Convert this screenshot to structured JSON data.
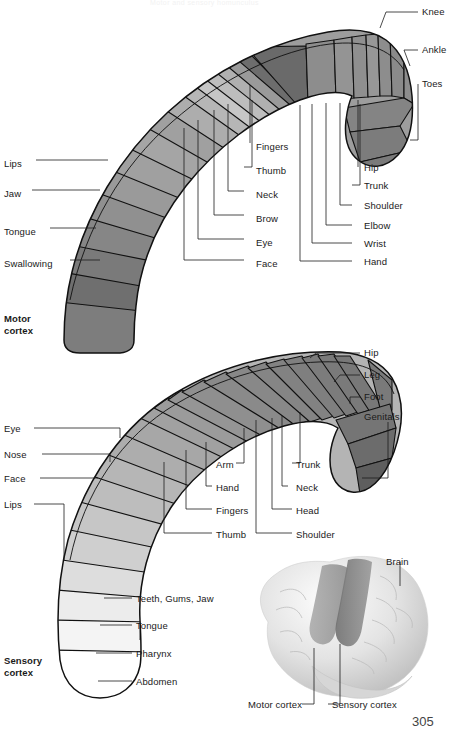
{
  "figure": {
    "top_title": "Motor and sensory homunculus",
    "page_number": "305"
  },
  "motor_cortex": {
    "caption": "Motor\ncortex",
    "left_labels": [
      {
        "text": "Lips",
        "x": 4,
        "y": 163
      },
      {
        "text": "Jaw",
        "x": 4,
        "y": 193
      },
      {
        "text": "Tongue",
        "x": 4,
        "y": 231
      },
      {
        "text": "Swallowing",
        "x": 4,
        "y": 263
      }
    ],
    "center_labels": [
      {
        "text": "Fingers",
        "x": 256,
        "y": 146
      },
      {
        "text": "Thumb",
        "x": 262,
        "y": 170
      },
      {
        "text": "Neck",
        "x": 256,
        "y": 194
      },
      {
        "text": "Brow",
        "x": 256,
        "y": 218
      },
      {
        "text": "Eye",
        "x": 256,
        "y": 242
      },
      {
        "text": "Face",
        "x": 256,
        "y": 263
      }
    ],
    "right_labels": [
      {
        "text": "Hip",
        "x": 364,
        "y": 170
      },
      {
        "text": "Trunk",
        "x": 364,
        "y": 188
      },
      {
        "text": "Shoulder",
        "x": 364,
        "y": 208
      },
      {
        "text": "Elbow",
        "x": 364,
        "y": 228
      },
      {
        "text": "Wrist",
        "x": 364,
        "y": 246
      },
      {
        "text": "Hand",
        "x": 364,
        "y": 264
      }
    ],
    "far_right_labels": [
      {
        "text": "Knee",
        "x": 422,
        "y": 10
      },
      {
        "text": "Ankle",
        "x": 422,
        "y": 48
      },
      {
        "text": "Toes",
        "x": 422,
        "y": 80
      }
    ]
  },
  "sensory_cortex": {
    "caption": "Sensory\ncortex",
    "left_labels": [
      {
        "text": "Eye",
        "x": 4,
        "y": 424
      },
      {
        "text": "Nose",
        "x": 4,
        "y": 450
      },
      {
        "text": "Face",
        "x": 4,
        "y": 474
      },
      {
        "text": "Lips",
        "x": 4,
        "y": 500
      }
    ],
    "lower_left_labels": [
      {
        "text": "Teeth, Gums, Jaw",
        "x": 136,
        "y": 595
      },
      {
        "text": "Tongue",
        "x": 136,
        "y": 622
      },
      {
        "text": "Pharynx",
        "x": 136,
        "y": 650
      },
      {
        "text": "Abdomen",
        "x": 136,
        "y": 678
      }
    ],
    "center_labels": [
      {
        "text": "Arm",
        "x": 216,
        "y": 466
      },
      {
        "text": "Hand",
        "x": 216,
        "y": 489
      },
      {
        "text": "Fingers",
        "x": 216,
        "y": 512
      },
      {
        "text": "Thumb",
        "x": 216,
        "y": 536
      }
    ],
    "right_labels": [
      {
        "text": "Trunk",
        "x": 296,
        "y": 466
      },
      {
        "text": "Neck",
        "x": 296,
        "y": 489
      },
      {
        "text": "Head",
        "x": 296,
        "y": 512
      },
      {
        "text": "Shoulder",
        "x": 296,
        "y": 536
      }
    ],
    "far_right_labels": [
      {
        "text": "Hip",
        "x": 364,
        "y": 350
      },
      {
        "text": "Leg",
        "x": 364,
        "y": 372
      },
      {
        "text": "Foot",
        "x": 364,
        "y": 394
      },
      {
        "text": "Genitals",
        "x": 364,
        "y": 414
      }
    ]
  },
  "brain_inset": {
    "title": "Brain",
    "labels": [
      {
        "text": "Motor cortex",
        "x": 253,
        "y": 707
      },
      {
        "text": "Sensory cortex",
        "x": 332,
        "y": 707
      }
    ]
  },
  "colors": {
    "ink": "#111111",
    "lightest": "#ffffff",
    "light": "#e9e9e9",
    "mid_light": "#c8c8c8",
    "mid": "#a8a8a8",
    "mid_dark": "#8e8e8e",
    "dark": "#6f6f6f",
    "darkest": "#5a5a5a",
    "brain_band": "#8a8a8a"
  }
}
